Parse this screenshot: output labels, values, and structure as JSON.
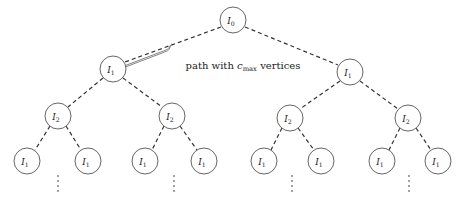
{
  "figure": {
    "type": "tree-diagram",
    "caption_label": {
      "prefix": "path with ",
      "symbol": "c",
      "symbol_sub": "max",
      "suffix": " vertices"
    },
    "colors": {
      "background": "#ffffff",
      "node_stroke": "#555555",
      "edge_stroke": "#333333",
      "brace_stroke": "#777777",
      "text": "#1a1a1a",
      "dots": "#777777"
    },
    "levels": [
      {
        "depth": 0,
        "nodes": [
          {
            "id": "root",
            "label": "I",
            "sub": "0",
            "cx": 233,
            "cy": 20,
            "r": 13
          }
        ]
      },
      {
        "depth": 1,
        "nodes": [
          {
            "id": "l1-left",
            "label": "I",
            "sub": "1",
            "cx": 113,
            "cy": 69,
            "r": 13
          },
          {
            "id": "l1-right",
            "label": "I",
            "sub": "1",
            "cx": 350,
            "cy": 72,
            "r": 13
          }
        ]
      },
      {
        "depth": 2,
        "nodes": [
          {
            "id": "l2-a",
            "label": "I",
            "sub": "2",
            "cx": 58,
            "cy": 116,
            "r": 13
          },
          {
            "id": "l2-b",
            "label": "I",
            "sub": "2",
            "cx": 172,
            "cy": 116,
            "r": 13
          },
          {
            "id": "l2-c",
            "label": "I",
            "sub": "2",
            "cx": 290,
            "cy": 118,
            "r": 13
          },
          {
            "id": "l2-d",
            "label": "I",
            "sub": "2",
            "cx": 408,
            "cy": 118,
            "r": 13
          }
        ]
      },
      {
        "depth": 3,
        "nodes": [
          {
            "id": "l3-a1",
            "label": "I",
            "sub": "1",
            "cx": 27,
            "cy": 161,
            "r": 13
          },
          {
            "id": "l3-a2",
            "label": "I",
            "sub": "1",
            "cx": 88,
            "cy": 161,
            "r": 13
          },
          {
            "id": "l3-b1",
            "label": "I",
            "sub": "1",
            "cx": 145,
            "cy": 161,
            "r": 13
          },
          {
            "id": "l3-b2",
            "label": "I",
            "sub": "1",
            "cx": 204,
            "cy": 161,
            "r": 13
          },
          {
            "id": "l3-c1",
            "label": "I",
            "sub": "1",
            "cx": 264,
            "cy": 161,
            "r": 13
          },
          {
            "id": "l3-c2",
            "label": "I",
            "sub": "1",
            "cx": 321,
            "cy": 161,
            "r": 13
          },
          {
            "id": "l3-d1",
            "label": "I",
            "sub": "1",
            "cx": 382,
            "cy": 161,
            "r": 13
          },
          {
            "id": "l3-d2",
            "label": "I",
            "sub": "1",
            "cx": 438,
            "cy": 161,
            "r": 13
          }
        ]
      }
    ],
    "edges": [
      {
        "from": "root",
        "to": "l1-left"
      },
      {
        "from": "root",
        "to": "l1-right"
      },
      {
        "from": "l1-left",
        "to": "l2-a"
      },
      {
        "from": "l1-left",
        "to": "l2-b"
      },
      {
        "from": "l1-right",
        "to": "l2-c"
      },
      {
        "from": "l1-right",
        "to": "l2-d"
      },
      {
        "from": "l2-a",
        "to": "l3-a1"
      },
      {
        "from": "l2-a",
        "to": "l3-a2"
      },
      {
        "from": "l2-b",
        "to": "l3-b1"
      },
      {
        "from": "l2-b",
        "to": "l3-b2"
      },
      {
        "from": "l2-c",
        "to": "l3-c1"
      },
      {
        "from": "l2-c",
        "to": "l3-c2"
      },
      {
        "from": "l2-d",
        "to": "l3-d1"
      },
      {
        "from": "l2-d",
        "to": "l3-d2"
      }
    ],
    "ellipses": [
      {
        "id": "dots-a",
        "cx": 58,
        "cy": 185,
        "glyph": "⋮"
      },
      {
        "id": "dots-b",
        "cx": 174,
        "cy": 185,
        "glyph": "⋮"
      },
      {
        "id": "dots-c",
        "cx": 292,
        "cy": 185,
        "glyph": "⋮"
      },
      {
        "id": "dots-d",
        "cx": 409,
        "cy": 185,
        "glyph": "⋮"
      }
    ],
    "brace": {
      "label_x": 243,
      "label_y": 68,
      "from": "root",
      "to": "l1-left"
    }
  }
}
